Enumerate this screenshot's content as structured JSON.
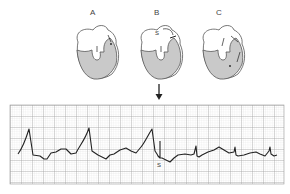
{
  "panels": [
    {
      "id": "A",
      "label": "A",
      "x": 93
    },
    {
      "id": "B",
      "label": "B",
      "x": 157,
      "annotation": "S"
    },
    {
      "id": "C",
      "label": "C",
      "x": 219
    }
  ],
  "ecg": {
    "annotation": "S",
    "grid_color": "#b8b8b8",
    "trace_color": "#222222",
    "fill_color": "#c9c9c9"
  }
}
